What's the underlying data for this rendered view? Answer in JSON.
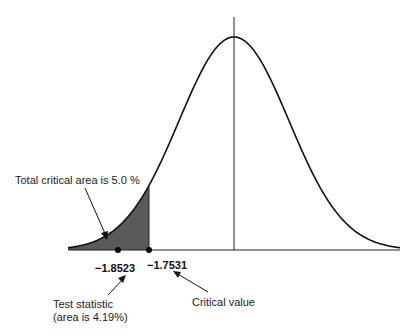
{
  "chart_data": {
    "type": "area",
    "title": "",
    "xlabel": "",
    "ylabel": "",
    "grid": false,
    "legend": null,
    "curve": {
      "shape": "bell",
      "mean_line": true
    },
    "shaded_region": {
      "side": "left",
      "upper_bound": -1.7531,
      "area_percent": 5.0
    },
    "points": [
      {
        "label": "-1.8523",
        "x": -1.8523,
        "role": "Test statistic",
        "area_percent": 4.19
      },
      {
        "label": "-1.7531",
        "x": -1.7531,
        "role": "Critical value"
      }
    ],
    "annotations": [
      "Total critical area is 5.0 %",
      "Test statistic (area is 4.19%)",
      "Critical value"
    ]
  },
  "labels": {
    "critical_area": "Total critical area is 5.0 %",
    "test_statistic_value": "−1.8523",
    "critical_value_value": "−1.7531",
    "test_statistic_line1": "Test statistic",
    "test_statistic_line2": "(area is 4.19%)",
    "critical_value": "Critical value"
  },
  "colors": {
    "curve": "#111111",
    "shade": "#555555",
    "axis": "#222222"
  }
}
